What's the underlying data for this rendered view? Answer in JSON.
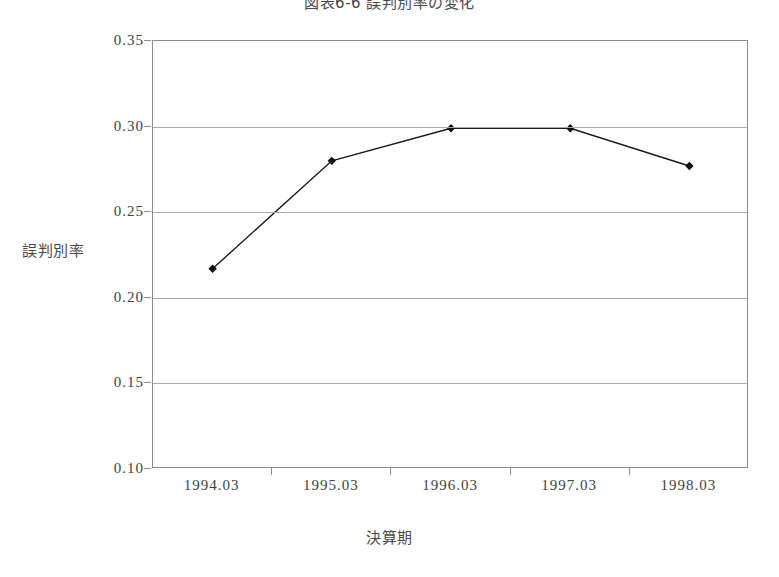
{
  "chart_data": {
    "type": "line",
    "title": "図表6-6  誤判別率の変化",
    "xlabel": "決算期",
    "ylabel": "誤判別率",
    "categories": [
      "1994.03",
      "1995.03",
      "1996.03",
      "1997.03",
      "1998.03"
    ],
    "values": [
      0.217,
      0.28,
      0.299,
      0.299,
      0.277
    ],
    "series": [
      {
        "name": "誤判別率",
        "values": [
          0.217,
          0.28,
          0.299,
          0.299,
          0.277
        ]
      }
    ],
    "ylim": [
      0.1,
      0.35
    ],
    "yticks": [
      "0.35",
      "0.30",
      "0.25",
      "0.20",
      "0.15",
      "0.10"
    ],
    "ytick_values": [
      0.35,
      0.3,
      0.25,
      0.2,
      0.15,
      0.1
    ],
    "grid": true,
    "legend": "none",
    "marker": "diamond",
    "line_color": "#1a1a1a",
    "marker_color": "#111111",
    "grid_color": "#a9a9a9",
    "frame_color": "#8d8d8d",
    "background": "#ffffff"
  }
}
